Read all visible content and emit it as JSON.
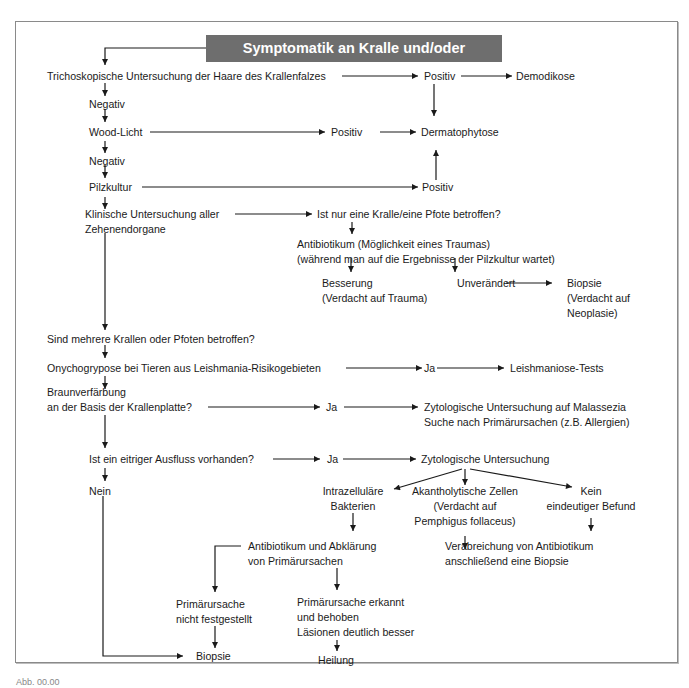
{
  "title": "Symptomatik an Kralle und/oder Krallenfalz",
  "nodes": {
    "tricho": "Trichoskopische Untersuchung der Haare des Krallenfalzes",
    "tricho_pos": "Positiv",
    "demodikose": "Demodikose",
    "neg1": "Negativ",
    "wood": "Wood-Licht",
    "wood_pos": "Positiv",
    "dermatophytose": "Dermatophytose",
    "neg2": "Negativ",
    "pilz": "Pilzkultur",
    "pilz_pos": "Positiv",
    "klinisch_1": "Klinische Untersuchung aller",
    "klinisch_2": "Zehenendorgane",
    "eine_kralle": "Ist nur eine Kralle/eine Pfote betroffen?",
    "antibiotikum_1": "Antibiotikum (Möglichkeit eines Traumas)",
    "antibiotikum_2": "(während man auf die Ergebnisse der Pilzkultur wartet)",
    "besserung_1": "Besserung",
    "besserung_2": "(Verdacht auf Trauma)",
    "unveraendert": "Unverändert",
    "biopsie_neo_1": "Biopsie",
    "biopsie_neo_2": "(Verdacht auf",
    "biopsie_neo_3": "Neoplasie)",
    "mehrere": "Sind mehrere Krallen oder Pfoten betroffen?",
    "onycho": "Onychogryposе bei Tieren aus Leishmania-Risikogebieten",
    "onycho_ja": "Ja",
    "leish": "Leishmaniose-Tests",
    "braun_1": "Braunverfärbung",
    "braun_2": "an der Basis der Krallenplatte?",
    "braun_ja": "Ja",
    "zyto_mal_1": "Zytologische Untersuchung auf Malassezia",
    "zyto_mal_2": "Suche nach Primärursachen (z.B. Allergien)",
    "eitrig": "Ist ein eitriger Ausfluss vorhanden?",
    "eitrig_ja": "Ja",
    "zyto": "Zytologische Untersuchung",
    "nein": "Nein",
    "intra_1": "Intrazelluläre",
    "intra_2": "Bakterien",
    "akan_1": "Akantholytische Zellen",
    "akan_2": "(Verdacht auf",
    "akan_3": "Pemphigus follaceus)",
    "kein_1": "Kein",
    "kein_2": "eindeutiger Befund",
    "ab_prim_1": "Antibiotikum und Abklärung",
    "ab_prim_2": "von Primärursachen",
    "verab_1": "Verabreichung von Antibiotikum",
    "verab_2": "anschließend eine Biopsie",
    "prim_nicht_1": "Primärursache",
    "prim_nicht_2": "nicht festgestellt",
    "prim_erk_1": "Primärursache erkannt",
    "prim_erk_2": "und behoben",
    "prim_erk_3": "Läsionen deutlich besser",
    "biopsie": "Biopsie",
    "heilung": "Heilung"
  },
  "colors": {
    "title_bg": "#6e6e6e",
    "line": "#1a1a1a",
    "frame": "#8a8a8a"
  },
  "caption": "Abb. 00.00"
}
